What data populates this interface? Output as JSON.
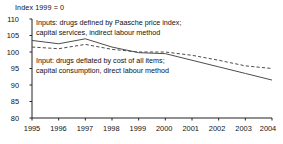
{
  "chart_data": {
    "type": "line",
    "title": "Index 1999 = 0",
    "xlabel": "",
    "ylabel": "",
    "x": [
      1995,
      1996,
      1997,
      1998,
      1999,
      2000,
      2001,
      2002,
      2003,
      2004
    ],
    "categories": [
      "1995",
      "1996",
      "1997",
      "1998",
      "1999",
      "2000",
      "2001",
      "2002",
      "2003",
      "2004"
    ],
    "xlim": [
      1995,
      2004
    ],
    "ylim": [
      80,
      110
    ],
    "yticks": [
      80,
      85,
      90,
      95,
      100,
      105,
      110
    ],
    "ytick_labels": [
      "80",
      "85",
      "90",
      "95",
      "100",
      "105",
      "110"
    ],
    "xticks": [
      1995,
      1996,
      1997,
      1998,
      1999,
      2000,
      2001,
      2002,
      2003,
      2004
    ],
    "grid": false,
    "legend_position": "inline-annotations",
    "series": [
      {
        "name": "Inputs: drugs defined by Paasche price index; capital services, indirect labour method",
        "style": "solid",
        "color": "#4d4d4d",
        "values": [
          103.5,
          102.5,
          104.0,
          101.5,
          99.8,
          99.5,
          97.5,
          95.5,
          93.5,
          91.5
        ]
      },
      {
        "name": "Input: drugs deflated by cost of all items; capital consumption, direct labour method",
        "style": "dashed",
        "color": "#4d4d4d",
        "values": [
          101.5,
          101.0,
          102.3,
          100.8,
          100.0,
          100.0,
          99.0,
          97.5,
          95.8,
          95.0
        ]
      }
    ],
    "annotations": [
      {
        "id": "upper",
        "line1": "Inputs: drugs defined by Paasche price index;",
        "line2": "capital services, indirect labour method"
      },
      {
        "id": "lower",
        "line1": "Input: drugs deflated by cost of all items;",
        "line2": "capital consumption, direct labour method"
      }
    ]
  }
}
